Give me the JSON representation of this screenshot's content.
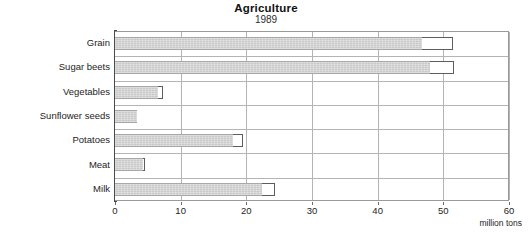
{
  "chart_data": {
    "type": "bar",
    "orientation": "horizontal",
    "stacked": true,
    "title": "Agriculture",
    "subtitle": "1989",
    "xlabel": "million tons",
    "ylabel": "",
    "xlim": [
      0,
      60
    ],
    "xticks": [
      0,
      10,
      20,
      30,
      40,
      50,
      60
    ],
    "xticklabels": [
      "0",
      "10",
      "20",
      "30",
      "40",
      "50",
      "60"
    ],
    "grid": true,
    "legend": "none",
    "categories": [
      "Grain",
      "Sugar beets",
      "Vegetables",
      "Sunflower seeds",
      "Potatoes",
      "Meat",
      "Milk"
    ],
    "series": [
      {
        "name": "filled",
        "style": "gray-hatched",
        "color": "#c9c9c9",
        "values": [
          46.7,
          48.0,
          6.5,
          3.3,
          18.0,
          4.3,
          22.4
        ]
      },
      {
        "name": "total",
        "style": "white-outline",
        "color": "#ffffff",
        "values": [
          51.5,
          51.7,
          7.3,
          3.3,
          19.5,
          4.6,
          24.3
        ]
      }
    ],
    "colors": {
      "fill": "#c9c9c9",
      "outline": "#5d5d5d",
      "gridline": "#b4b4b4",
      "axis": "#4a4a4a",
      "background": "#ffffff",
      "text": "#1d1d1d"
    }
  }
}
